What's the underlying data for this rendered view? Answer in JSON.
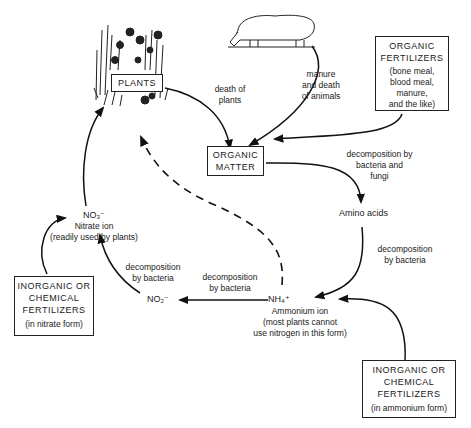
{
  "diagram": {
    "nodes": {
      "plants": {
        "label": "PLANTS"
      },
      "organic_matter": {
        "label_line1": "ORGANIC",
        "label_line2": "MATTER"
      },
      "amino_acids": {
        "label": "Amino acids"
      },
      "ammonium": {
        "formula": "NH₄⁺",
        "name": "Ammonium ion",
        "note_line1": "(most plants cannot",
        "note_line2": "use nitrogen in this form)"
      },
      "nitrite": {
        "formula": "NO₂⁻"
      },
      "nitrate": {
        "formula": "NO₃⁻",
        "name": "Nitrate ion",
        "note": "(readily used by plants)"
      },
      "organic_fertilizers": {
        "title_line1": "ORGANIC",
        "title_line2": "FERTILIZERS",
        "sub_line1": "(bone meal,",
        "sub_line2": "blood meal,",
        "sub_line3": "manure,",
        "sub_line4": "and the like)"
      },
      "inorganic_nitrate": {
        "title_line1": "INORGANIC OR",
        "title_line2": "CHEMICAL",
        "title_line3": "FERTILIZERS",
        "sub": "(in nitrate form)"
      },
      "inorganic_ammonium": {
        "title_line1": "INORGANIC OR",
        "title_line2": "CHEMICAL",
        "title_line3": "FERTILIZERS",
        "sub": "(in ammonium form)"
      }
    },
    "edge_labels": {
      "death_of_plants": {
        "line1": "death of",
        "line2": "plants"
      },
      "manure_animals": {
        "line1": "manure",
        "line2": "and death",
        "line3": "of animals"
      },
      "decomp_bact_fungi": {
        "line1": "decomposition by",
        "line2": "bacteria and",
        "line3": "fungi"
      },
      "decomp_amino": {
        "line1": "decomposition",
        "line2": "by bacteria"
      },
      "decomp_ammonium": {
        "line1": "decomposition",
        "line2": "by bacteria"
      },
      "decomp_nitrite": {
        "line1": "decomposition",
        "line2": "by bacteria"
      }
    },
    "illustrations": {
      "plants": "plants-illustration",
      "animal": "sheep-illustration"
    }
  }
}
